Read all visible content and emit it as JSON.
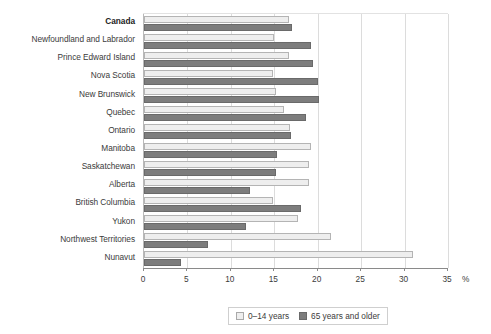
{
  "chart_data": {
    "type": "bar",
    "orientation": "horizontal",
    "title": "",
    "subtitle": "",
    "xlabel": "%",
    "ylabel": "",
    "xlim": [
      0,
      35
    ],
    "xticks": [
      0,
      5,
      10,
      15,
      20,
      25,
      30,
      35
    ],
    "xtick_labels": [
      "0",
      "5",
      "10",
      "15",
      "20",
      "25",
      "30",
      "35"
    ],
    "grid": true,
    "grid_axis": "x",
    "legend_position": "bottom",
    "categories": [
      "Canada",
      "Newfoundland and Labrador",
      "Prince Edward Island",
      "Nova Scotia",
      "New Brunswick",
      "Quebec",
      "Ontario",
      "Manitoba",
      "Saskatchewan",
      "Alberta",
      "British Columbia",
      "Yukon",
      "Northwest Territories",
      "Nunavut"
    ],
    "emphasized_category": "Canada",
    "series": [
      {
        "name": "0–14 years",
        "color": "#eeeeee",
        "values": [
          16.7,
          15.0,
          16.7,
          14.9,
          15.2,
          16.1,
          16.8,
          19.2,
          19.0,
          19.0,
          14.9,
          17.7,
          21.5,
          31.0
        ]
      },
      {
        "name": "65 years and older",
        "color": "#7d7d7d",
        "values": [
          17.0,
          19.2,
          19.5,
          20.0,
          20.2,
          18.6,
          16.9,
          15.3,
          15.2,
          12.2,
          18.1,
          11.7,
          7.4,
          4.3
        ]
      }
    ]
  },
  "legend": {
    "items": [
      {
        "label": "0–14 years",
        "swatch": "young"
      },
      {
        "label": "65 years and older",
        "swatch": "old"
      }
    ]
  },
  "axis": {
    "unit_symbol": "%"
  }
}
